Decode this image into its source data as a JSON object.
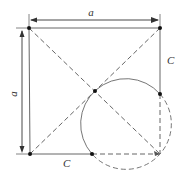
{
  "diagram": {
    "labels": {
      "top_dimension": "a",
      "left_dimension": "a",
      "right_segment": "C",
      "bottom_segment": "C"
    },
    "colors": {
      "line": "#555555",
      "point": "#111111",
      "background": "#ffffff"
    },
    "points": [
      {
        "name": "top-left-corner",
        "x": 29,
        "y": 28
      },
      {
        "name": "top-right-corner",
        "x": 160,
        "y": 28
      },
      {
        "name": "bottom-left-corner",
        "x": 30,
        "y": 154
      },
      {
        "name": "center",
        "x": 95,
        "y": 91
      },
      {
        "name": "right-c-point",
        "x": 160,
        "y": 94
      },
      {
        "name": "bottom-c-point",
        "x": 92,
        "y": 154
      }
    ]
  }
}
